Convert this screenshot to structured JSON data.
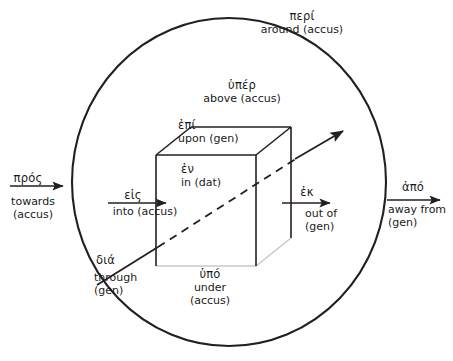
{
  "diagram": {
    "colors": {
      "stroke": "#231f20",
      "cube_shadow": "#c9c9c9",
      "text": "#1a1a1a",
      "background": "#ffffff"
    },
    "shapes": {
      "circle_label": "sphere-of-reference-circle",
      "cube_label": "reference-cube"
    },
    "labels": [
      {
        "id": "peri",
        "name": "label-peri",
        "greek": "περί",
        "english": "around (accus)",
        "case": "accus",
        "position": "top-outer-circle"
      },
      {
        "id": "hyper",
        "name": "label-hyper",
        "greek": "ὑπέρ",
        "english": "above (accus)",
        "case": "accus",
        "position": "above-cube"
      },
      {
        "id": "epi",
        "name": "label-epi",
        "greek": "ἐπί",
        "english": "upon (gen)",
        "case": "gen",
        "position": "cube-top-face"
      },
      {
        "id": "en",
        "name": "label-en",
        "greek": "ἐν",
        "english": "in (dat)",
        "case": "dat",
        "position": "cube-interior"
      },
      {
        "id": "pros",
        "name": "label-pros",
        "greek": "πρός",
        "english_line1": "towards",
        "english_line2": "(accus)",
        "case": "accus",
        "position": "far-left-outside-circle"
      },
      {
        "id": "eis",
        "name": "label-eis",
        "greek": "εἰς",
        "english": "into (accus)",
        "case": "accus",
        "position": "left-entering-cube"
      },
      {
        "id": "ek",
        "name": "label-ek",
        "greek": "ἐκ",
        "english_line1": "out of",
        "english_line2": "(gen)",
        "case": "gen",
        "position": "right-exiting-cube"
      },
      {
        "id": "apo",
        "name": "label-apo",
        "greek": "ἀπό",
        "english_line1": "away from",
        "english_line2": "(gen)",
        "case": "gen",
        "position": "far-right-outside-circle"
      },
      {
        "id": "dia",
        "name": "label-dia",
        "greek": "διά",
        "english_line1": "through",
        "english_line2": "(gen)",
        "case": "gen",
        "position": "lower-left-diagonal"
      },
      {
        "id": "hypo",
        "name": "label-hypo",
        "greek": "ὑπό",
        "english_line1": "under",
        "english_line2": "(accus)",
        "case": "accus",
        "position": "below-cube"
      }
    ]
  }
}
